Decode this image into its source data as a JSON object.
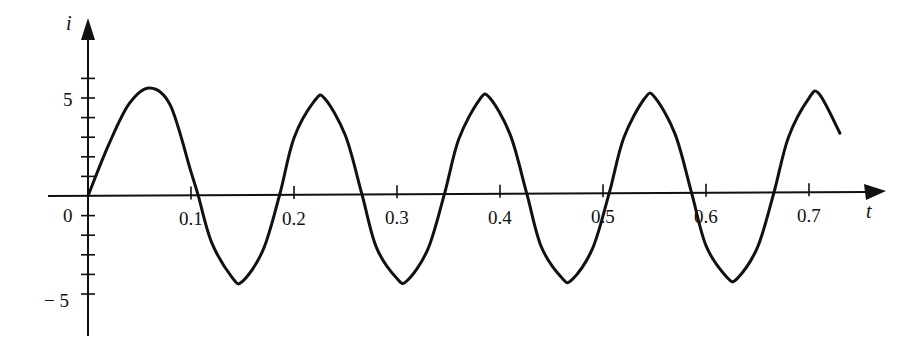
{
  "chart_data": {
    "type": "line",
    "title": "",
    "xlabel": "t",
    "ylabel": "i",
    "xlim": [
      0,
      0.75
    ],
    "ylim": [
      -6,
      6.5
    ],
    "grid": false,
    "legend": null,
    "x_ticks": [
      "0.1",
      "0.2",
      "0.3",
      "0.4",
      "0.5",
      "0.6",
      "0.7"
    ],
    "x_tick_values": [
      0.1,
      0.2,
      0.3,
      0.4,
      0.5,
      0.6,
      0.7
    ],
    "y_ticks_labeled": [
      "5",
      "0",
      "-5"
    ],
    "y_tick_values": [
      -5,
      -4,
      -3,
      -2,
      -1,
      0,
      1,
      2,
      3,
      4,
      5,
      6
    ],
    "series": [
      {
        "name": "i(t)",
        "description": "Damped-transient sinusoid: first peak ~5.5, then steady oscillation amplitude ~4.7 with period ~0.16",
        "x": [
          0.0,
          0.02,
          0.04,
          0.06,
          0.08,
          0.1,
          0.107,
          0.12,
          0.14,
          0.15,
          0.17,
          0.186,
          0.2,
          0.22,
          0.23,
          0.25,
          0.266,
          0.28,
          0.3,
          0.31,
          0.33,
          0.346,
          0.36,
          0.38,
          0.39,
          0.41,
          0.426,
          0.44,
          0.46,
          0.47,
          0.49,
          0.506,
          0.52,
          0.54,
          0.55,
          0.57,
          0.586,
          0.6,
          0.62,
          0.63,
          0.65,
          0.666,
          0.68,
          0.7,
          0.71,
          0.73
        ],
        "values": [
          0.0,
          2.6,
          4.7,
          5.5,
          4.6,
          1.2,
          0.0,
          -2.4,
          -4.2,
          -4.4,
          -2.8,
          0.0,
          2.9,
          4.8,
          4.9,
          3.0,
          0.0,
          -2.7,
          -4.3,
          -4.4,
          -2.8,
          0.0,
          2.8,
          4.8,
          4.9,
          3.0,
          0.0,
          -2.7,
          -4.3,
          -4.4,
          -2.8,
          0.0,
          2.8,
          4.8,
          4.9,
          3.0,
          0.0,
          -2.7,
          -4.3,
          -4.4,
          -2.8,
          0.0,
          2.8,
          4.8,
          5.0,
          3.0
        ]
      }
    ]
  },
  "labels": {
    "origin": "0",
    "y_axis": "i",
    "x_axis": "t",
    "y5": "5",
    "yneg5": "− 5"
  }
}
